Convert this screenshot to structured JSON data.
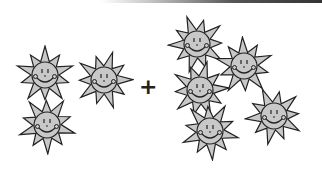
{
  "equation": {
    "operator": "+",
    "left_group": {
      "count": 3,
      "item": "sun-smiley"
    },
    "right_group": {
      "count": 5,
      "item": "sun-smiley"
    }
  },
  "colors": {
    "sun_fill": "#c8c8c8",
    "outline": "#222222",
    "background": "#ffffff"
  },
  "suns": [
    {
      "x": 15,
      "y": 45,
      "group": "left"
    },
    {
      "x": 74,
      "y": 50,
      "group": "left"
    },
    {
      "x": 17,
      "y": 95,
      "group": "left"
    },
    {
      "x": 167,
      "y": 14,
      "group": "right"
    },
    {
      "x": 214,
      "y": 36,
      "group": "right"
    },
    {
      "x": 170,
      "y": 60,
      "group": "right"
    },
    {
      "x": 180,
      "y": 101,
      "group": "right"
    },
    {
      "x": 244,
      "y": 86,
      "group": "right"
    }
  ]
}
